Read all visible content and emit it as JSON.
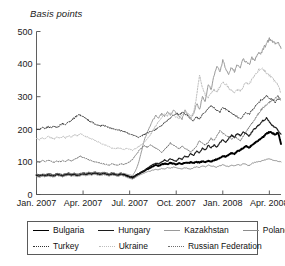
{
  "chart_data": {
    "type": "line",
    "title": "",
    "ylabel": "Basis points",
    "xlabel": "",
    "ylim": [
      0,
      500
    ],
    "yticks": [
      0,
      100,
      200,
      300,
      400,
      500
    ],
    "grid": false,
    "legend_position": "bottom",
    "x_tick_labels": [
      "Jan. 2007",
      "Apr. 2007",
      "Jul. 2007",
      "Oct. 2007",
      "Jan. 2008",
      "Apr. 2008"
    ],
    "x_tick_positions": [
      0,
      0.2,
      0.4,
      0.6,
      0.8,
      1.0
    ],
    "x": [
      0,
      0.0125,
      0.025,
      0.0375,
      0.05,
      0.0625,
      0.075,
      0.0875,
      0.1,
      0.1125,
      0.125,
      0.1375,
      0.15,
      0.1625,
      0.175,
      0.1875,
      0.2,
      0.2125,
      0.225,
      0.2375,
      0.25,
      0.2625,
      0.275,
      0.2875,
      0.3,
      0.3125,
      0.325,
      0.3375,
      0.35,
      0.3625,
      0.375,
      0.3875,
      0.4,
      0.4125,
      0.425,
      0.4375,
      0.45,
      0.4625,
      0.475,
      0.4875,
      0.5,
      0.5125,
      0.525,
      0.5375,
      0.55,
      0.5625,
      0.575,
      0.5875,
      0.6,
      0.6125,
      0.625,
      0.6375,
      0.65,
      0.6625,
      0.675,
      0.6875,
      0.7,
      0.7125,
      0.725,
      0.7375,
      0.75,
      0.7625,
      0.775,
      0.7875,
      0.8,
      0.8125,
      0.825,
      0.8375,
      0.85,
      0.8625,
      0.875,
      0.8875,
      0.9,
      0.9125,
      0.925,
      0.9375,
      0.95,
      0.9625,
      0.975,
      0.9875,
      1.0,
      1.0125,
      1.025,
      1.0375,
      1.05
    ],
    "series": [
      {
        "name": "Bulgaria",
        "color": "#000000",
        "width": 1.9,
        "dash": "none",
        "values": [
          60,
          58,
          61,
          59,
          62,
          60,
          58,
          63,
          61,
          59,
          62,
          64,
          61,
          63,
          60,
          62,
          65,
          63,
          66,
          64,
          67,
          65,
          63,
          66,
          64,
          62,
          65,
          63,
          61,
          64,
          62,
          58,
          55,
          52,
          58,
          63,
          68,
          72,
          78,
          82,
          86,
          90,
          88,
          92,
          95,
          93,
          97,
          95,
          92,
          96,
          94,
          98,
          96,
          99,
          97,
          100,
          98,
          102,
          99,
          103,
          101,
          105,
          108,
          112,
          118,
          116,
          122,
          127,
          125,
          132,
          137,
          142,
          148,
          143,
          152,
          158,
          165,
          172,
          178,
          186,
          192,
          188,
          184,
          190,
          155
        ]
      },
      {
        "name": "Hungary",
        "color": "#1c1c1c",
        "width": 1.15,
        "dash": "none",
        "values": [
          58,
          56,
          59,
          57,
          60,
          58,
          56,
          61,
          59,
          57,
          60,
          62,
          59,
          61,
          58,
          60,
          63,
          61,
          64,
          62,
          65,
          63,
          61,
          64,
          62,
          60,
          63,
          61,
          59,
          62,
          60,
          56,
          53,
          50,
          56,
          62,
          68,
          74,
          80,
          86,
          92,
          96,
          94,
          100,
          106,
          102,
          110,
          106,
          102,
          112,
          108,
          118,
          114,
          126,
          120,
          134,
          128,
          142,
          136,
          150,
          144,
          152,
          146,
          158,
          168,
          160,
          172,
          182,
          175,
          188,
          180,
          192,
          186,
          178,
          192,
          202,
          210,
          218,
          228,
          234,
          224,
          212,
          206,
          196,
          185
        ]
      },
      {
        "name": "Kazakhstan",
        "color": "#9a9a9a",
        "width": 1.0,
        "dash": "none",
        "values": [
          62,
          60,
          63,
          61,
          64,
          62,
          60,
          65,
          63,
          61,
          64,
          66,
          63,
          65,
          62,
          64,
          67,
          65,
          68,
          66,
          69,
          67,
          65,
          68,
          66,
          64,
          67,
          65,
          63,
          66,
          64,
          62,
          60,
          58,
          72,
          95,
          130,
          165,
          190,
          210,
          228,
          242,
          235,
          248,
          240,
          252,
          245,
          258,
          250,
          240,
          232,
          258,
          245,
          235,
          248,
          280,
          260,
          300,
          285,
          340,
          320,
          365,
          395,
          375,
          412,
          385,
          365,
          390,
          378,
          400,
          392,
          415,
          408,
          398,
          420,
          412,
          435,
          428,
          448,
          462,
          478,
          470,
          462,
          468,
          448
        ]
      },
      {
        "name": "Poland",
        "color": "#8c8c8c",
        "width": 1.0,
        "dash": "none",
        "values": [
          55,
          53,
          56,
          54,
          57,
          55,
          53,
          58,
          56,
          54,
          57,
          59,
          56,
          58,
          55,
          57,
          60,
          58,
          61,
          59,
          62,
          60,
          58,
          61,
          59,
          57,
          60,
          58,
          56,
          59,
          57,
          53,
          50,
          47,
          52,
          58,
          62,
          66,
          70,
          72,
          75,
          78,
          76,
          80,
          78,
          82,
          80,
          84,
          82,
          80,
          78,
          82,
          80,
          78,
          82,
          85,
          83,
          88,
          85,
          90,
          88,
          86,
          84,
          88,
          92,
          88,
          86,
          90,
          88,
          92,
          90,
          94,
          92,
          88,
          95,
          98,
          100,
          102,
          105,
          108,
          110,
          106,
          104,
          102,
          100
        ]
      },
      {
        "name": "Turkey",
        "color": "#303030",
        "width": 0.95,
        "dash": "1.4,1.4",
        "values": [
          200,
          198,
          205,
          202,
          208,
          204,
          210,
          206,
          212,
          218,
          214,
          222,
          228,
          235,
          242,
          245,
          238,
          232,
          226,
          222,
          218,
          214,
          210,
          212,
          208,
          205,
          202,
          200,
          198,
          196,
          194,
          190,
          186,
          182,
          178,
          176,
          180,
          184,
          188,
          192,
          196,
          200,
          205,
          212,
          220,
          228,
          235,
          242,
          248,
          245,
          252,
          248,
          240,
          232,
          226,
          238,
          232,
          245,
          252,
          262,
          272,
          265,
          258,
          252,
          268,
          262,
          256,
          250,
          244,
          238,
          232,
          242,
          252,
          245,
          258,
          268,
          278,
          288,
          295,
          302,
          296,
          290,
          284,
          292,
          288
        ]
      },
      {
        "name": "Ukraine",
        "color": "#bdbdbd",
        "width": 1.0,
        "dash": "1.4,1.4",
        "values": [
          172,
          168,
          175,
          170,
          178,
          174,
          170,
          176,
          172,
          178,
          174,
          180,
          176,
          184,
          180,
          186,
          182,
          178,
          174,
          170,
          166,
          162,
          158,
          154,
          150,
          146,
          142,
          140,
          144,
          140,
          138,
          142,
          138,
          136,
          140,
          146,
          152,
          160,
          170,
          182,
          196,
          210,
          225,
          238,
          248,
          242,
          252,
          245,
          238,
          232,
          245,
          255,
          248,
          240,
          252,
          300,
          368,
          330,
          305,
          298,
          310,
          322,
          315,
          330,
          345,
          338,
          328,
          318,
          310,
          322,
          316,
          330,
          345,
          338,
          352,
          365,
          378,
          388,
          382,
          374,
          366,
          356,
          346,
          336,
          310
        ]
      },
      {
        "name": "Russian Federation",
        "color": "#6e6e6e",
        "width": 1.0,
        "dash": "1.4,1.4",
        "values": [
          102,
          100,
          104,
          101,
          105,
          102,
          99,
          103,
          100,
          104,
          101,
          106,
          103,
          108,
          112,
          118,
          114,
          110,
          106,
          103,
          100,
          98,
          96,
          94,
          92,
          90,
          94,
          92,
          90,
          94,
          92,
          96,
          100,
          108,
          120,
          132,
          142,
          150,
          145,
          152,
          148,
          142,
          136,
          130,
          138,
          148,
          158,
          152,
          146,
          140,
          148,
          142,
          136,
          130,
          138,
          148,
          165,
          158,
          152,
          160,
          172,
          165,
          180,
          195,
          188,
          182,
          176,
          170,
          178,
          172,
          166,
          178,
          192,
          205,
          218,
          232,
          245,
          258,
          268,
          276,
          282,
          290,
          296,
          302,
          290
        ]
      }
    ]
  }
}
